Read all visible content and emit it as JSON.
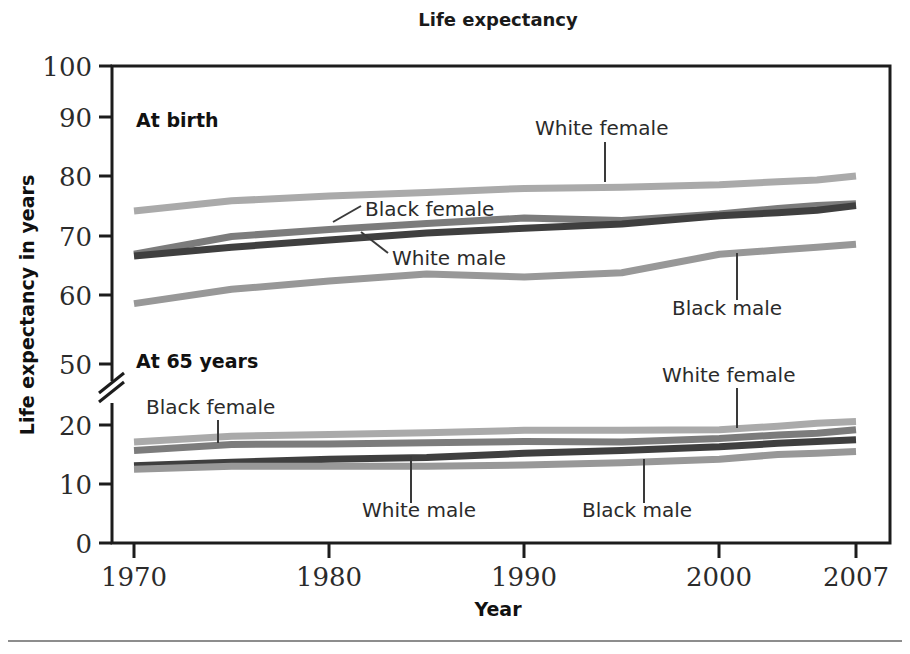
{
  "chart_data": {
    "type": "line",
    "title": "Life expectancy",
    "xlabel": "Year",
    "ylabel": "Life expectancy in years",
    "grid": false,
    "legend": "annotations-on-plot",
    "axis_break": {
      "present": true,
      "between": [
        50,
        20
      ]
    },
    "xlim": [
      1970,
      2007
    ],
    "xticks": [
      1970,
      1980,
      1990,
      2000,
      2007
    ],
    "xticklabels": [
      "1970",
      "1980",
      "1990",
      "2000",
      "2007"
    ],
    "yticks": [
      0,
      10,
      20,
      50,
      60,
      70,
      80,
      90,
      100
    ],
    "yticklabels": [
      "0",
      "10",
      "20",
      "50",
      "60",
      "70",
      "80",
      "90",
      "100"
    ],
    "groups": [
      {
        "name": "At birth",
        "label": "At birth"
      },
      {
        "name": "At 65 years",
        "label": "At 65 years"
      }
    ],
    "x": [
      1970,
      1975,
      1980,
      1985,
      1990,
      1995,
      2000,
      2003,
      2005,
      2007
    ],
    "series": [
      {
        "name": "White female at birth",
        "group": "At birth",
        "label": "White female",
        "color": "#aaaaaa",
        "values": [
          75.6,
          77.3,
          78.1,
          78.7,
          79.4,
          79.6,
          80.0,
          80.5,
          80.8,
          81.5
        ]
      },
      {
        "name": "Black female at birth",
        "group": "At birth",
        "label": "Black female",
        "color": "#7c7c7c",
        "values": [
          68.3,
          71.3,
          72.5,
          73.5,
          74.4,
          74.0,
          75.1,
          76.0,
          76.5,
          76.8
        ]
      },
      {
        "name": "White male at birth",
        "group": "At birth",
        "label": "White male",
        "color": "#3f3f3f",
        "values": [
          68.0,
          69.5,
          70.7,
          71.9,
          72.7,
          73.4,
          74.8,
          75.3,
          75.7,
          76.5
        ]
      },
      {
        "name": "Black male at birth",
        "group": "At birth",
        "label": "Black male",
        "color": "#989898",
        "values": [
          60.0,
          62.4,
          63.8,
          65.0,
          64.5,
          65.2,
          68.3,
          69.0,
          69.5,
          70.0
        ]
      },
      {
        "name": "White female at 65 years",
        "group": "At 65 years",
        "label": "White female",
        "color": "#aaaaaa",
        "values": [
          17.1,
          18.1,
          18.4,
          18.7,
          19.1,
          19.1,
          19.2,
          19.8,
          20.3,
          20.6
        ]
      },
      {
        "name": "Black female at 65 years",
        "group": "At 65 years",
        "label": "Black female",
        "color": "#7c7c7c",
        "values": [
          15.7,
          16.7,
          16.8,
          17.0,
          17.2,
          17.1,
          17.7,
          18.3,
          18.6,
          19.2
        ]
      },
      {
        "name": "White male at 65 years",
        "group": "At 65 years",
        "label": "White male",
        "color": "#3f3f3f",
        "values": [
          13.1,
          13.7,
          14.2,
          14.5,
          15.2,
          15.7,
          16.3,
          16.9,
          17.2,
          17.5
        ]
      },
      {
        "name": "Black male at 65 years",
        "group": "At 65 years",
        "label": "Black male",
        "color": "#989898",
        "values": [
          12.5,
          13.0,
          13.0,
          13.0,
          13.2,
          13.6,
          14.2,
          15.0,
          15.2,
          15.5
        ]
      }
    ],
    "annotations": [
      {
        "id": "birth-white-female",
        "text": "White female",
        "x": 535,
        "y": 132
      },
      {
        "id": "birth-black-female",
        "text": "Black female",
        "x": 365,
        "y": 215
      },
      {
        "id": "birth-white-male",
        "text": "White male",
        "x": 392,
        "y": 262
      },
      {
        "id": "birth-black-male",
        "text": "Black male",
        "x": 672,
        "y": 312
      },
      {
        "id": "age65-black-female",
        "text": "Black female",
        "x": 146,
        "y": 412
      },
      {
        "id": "age65-white-female",
        "text": "White female",
        "x": 662,
        "y": 380
      },
      {
        "id": "age65-white-male",
        "text": "White male",
        "x": 362,
        "y": 515
      },
      {
        "id": "age65-black-male",
        "text": "Black male",
        "x": 582,
        "y": 515
      }
    ]
  }
}
